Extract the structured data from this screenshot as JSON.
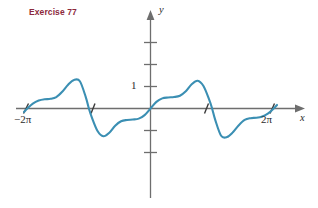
{
  "figure": {
    "exercise_label": "Exercise 77",
    "exercise_label_color": "#8c2a3c",
    "curve_color": "#3b8fb3",
    "axis_color": "#6e6e6e",
    "background": "#ffffff"
  },
  "axes": {
    "y_axis_label": "y",
    "x_axis_label": "x",
    "y_tick_label": "1",
    "x_tick_label_left": "−2π",
    "x_tick_label_right": "2π"
  },
  "chart_data": {
    "type": "line",
    "title": "Exercise 77",
    "xlabel": "x",
    "ylabel": "y",
    "xlim": [
      -7.3,
      7.3
    ],
    "ylim": [
      -2.4,
      3.2
    ],
    "grid": false,
    "legend": null,
    "x_tick_values": [
      -6.2832,
      -3.1416,
      3.1416,
      6.2832
    ],
    "x_tick_labels": [
      "−2π",
      "",
      "",
      "2π"
    ],
    "y_tick_values": [
      -2,
      -1,
      1,
      2,
      3
    ],
    "y_tick_labels": [
      "",
      "",
      "1",
      "",
      ""
    ],
    "series": [
      {
        "name": "y = f(x)",
        "color": "#3b8fb3",
        "x": [
          -6.45,
          -6.28,
          -6.0,
          -5.7,
          -5.4,
          -5.1,
          -4.8,
          -4.5,
          -4.2,
          -3.9,
          -3.6,
          -3.3,
          -3.14,
          -3.0,
          -2.7,
          -2.4,
          -2.1,
          -1.8,
          -1.5,
          -1.2,
          -0.9,
          -0.6,
          -0.3,
          0.0,
          0.3,
          0.6,
          0.9,
          1.2,
          1.5,
          1.8,
          2.1,
          2.4,
          2.7,
          3.0,
          3.14,
          3.3,
          3.6,
          3.9,
          4.2,
          4.5,
          4.8,
          5.1,
          5.4,
          5.7,
          6.0,
          6.28,
          6.45
        ],
        "y": [
          -0.16,
          0.0,
          0.22,
          0.36,
          0.42,
          0.44,
          0.52,
          0.76,
          1.08,
          1.3,
          1.24,
          0.52,
          0.0,
          -0.38,
          -1.02,
          -1.26,
          -1.1,
          -0.78,
          -0.58,
          -0.52,
          -0.5,
          -0.46,
          -0.3,
          0.0,
          0.3,
          0.46,
          0.5,
          0.52,
          0.58,
          0.78,
          1.1,
          1.26,
          1.02,
          0.38,
          0.0,
          -0.52,
          -1.24,
          -1.3,
          -1.08,
          -0.76,
          -0.52,
          -0.44,
          -0.42,
          -0.36,
          -0.22,
          0.0,
          0.16
        ]
      }
    ],
    "annotations": [
      {
        "text": "1",
        "x": -0.45,
        "y": 1.0
      },
      {
        "text": "−2π",
        "x": -6.28,
        "y": -0.55
      },
      {
        "text": "2π",
        "x": 6.0,
        "y": -0.55
      },
      {
        "text": "y",
        "x": 0.45,
        "y": 3.05
      },
      {
        "text": "x",
        "x": 7.05,
        "y": -0.3
      }
    ]
  }
}
